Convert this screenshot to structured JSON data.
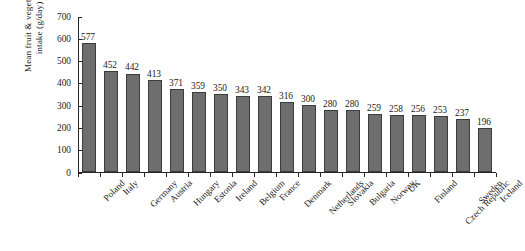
{
  "chart_data": {
    "type": "bar",
    "title": "",
    "xlabel": "",
    "ylabel": "Mean fruit & vegetable\nintake (g/day)",
    "ylim": [
      0,
      700
    ],
    "yticks": [
      0,
      100,
      200,
      300,
      400,
      500,
      600,
      700
    ],
    "ytick_labels": [
      "0",
      "100",
      "200",
      "300",
      "400",
      "500",
      "600",
      "700"
    ],
    "grid": false,
    "legend": false,
    "bar_color": "#6e6e6e",
    "bar_edge_color": "#3c3c3c",
    "axis_color": "#262626",
    "background": "#ffffff",
    "show_value_labels": true,
    "categories": [
      "Poland",
      "Italy",
      "Germany",
      "Austria",
      "Hungary",
      "Estonia",
      "Ireland",
      "Belgium",
      "France",
      "Denmark",
      "Netherlands",
      "Slovakia",
      "Bulgaria",
      "Norway",
      "UK",
      "Finland",
      "Czech Republic",
      "Sweden",
      "Iceland"
    ],
    "values": [
      577,
      452,
      442,
      413,
      371,
      359,
      350,
      343,
      342,
      316,
      300,
      280,
      280,
      259,
      258,
      256,
      253,
      237,
      196
    ],
    "value_labels": [
      "577",
      "452",
      "442",
      "413",
      "371",
      "359",
      "350",
      "343",
      "342",
      "316",
      "300",
      "280",
      "280",
      "259",
      "258",
      "256",
      "253",
      "237",
      "196"
    ]
  }
}
